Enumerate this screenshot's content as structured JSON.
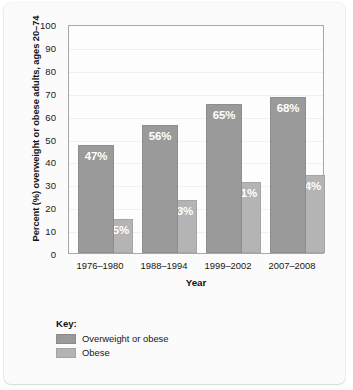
{
  "chart_data": {
    "type": "bar",
    "title": "",
    "xlabel": "Year",
    "ylabel": "Percent (%) overweight or obese adults, ages 20–74",
    "ylim": [
      0,
      100
    ],
    "yticks": [
      100,
      90,
      80,
      70,
      60,
      50,
      40,
      30,
      20,
      10,
      0
    ],
    "grid": true,
    "legend_position": "bottom-left",
    "legend_title": "Key:",
    "categories": [
      "1976–1980",
      "1988–1994",
      "1999–2002",
      "2007–2008"
    ],
    "series": [
      {
        "name": "Overweight or obese",
        "color": "#9a9a9a",
        "values": [
          47,
          56,
          65,
          68
        ],
        "labels": [
          "47%",
          "56%",
          "65%",
          "68%"
        ]
      },
      {
        "name": "Obese",
        "color": "#b4b4b4",
        "values": [
          15,
          23,
          31,
          34
        ],
        "labels": [
          "15%",
          "23%",
          "31%",
          "34%"
        ]
      }
    ]
  }
}
